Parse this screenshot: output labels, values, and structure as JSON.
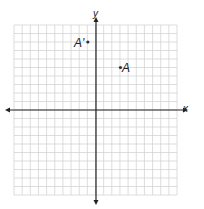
{
  "graph": {
    "x_axis_label": "x",
    "y_axis_label": "y",
    "x_range": [
      -10,
      10
    ],
    "y_range": [
      -10,
      10
    ],
    "grid_spacing": 1,
    "grid_color": "#cfcfcf",
    "axis_color": "#222222"
  },
  "points": [
    {
      "name": "A",
      "label": "A",
      "x": 3,
      "y": 5
    },
    {
      "name": "A-prime",
      "label": "A'",
      "x": -1,
      "y": 8
    }
  ]
}
